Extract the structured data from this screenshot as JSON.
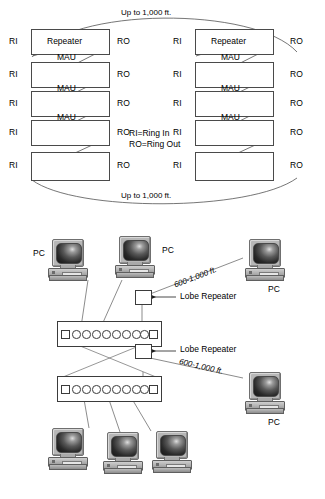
{
  "figure": {
    "colors": {
      "line": "#3b3b3b",
      "box_stroke": "#4a4a4a",
      "text": "#000000",
      "background": "#ffffff"
    }
  },
  "top_diagram": {
    "arc_label_top": "Up to 1,000 ft.",
    "arc_label_bottom": "Up to 1,000 ft.",
    "legend": {
      "line1": "RI=Ring In",
      "line2": "RO=Ring Out"
    },
    "port_in_label": "RI",
    "port_out_label": "RO",
    "left_column": [
      {
        "box_label": "Repeater",
        "under_label": "MAU",
        "ri": "RI",
        "ro": "RO"
      },
      {
        "box_label": "",
        "under_label": "MAU",
        "ri": "RI",
        "ro": "RO"
      },
      {
        "box_label": "",
        "under_label": "MAU",
        "ri": "RI",
        "ro": "RO"
      },
      {
        "box_label": "",
        "under_label": "",
        "ri": "RI",
        "ro": "RO"
      },
      {
        "box_label": "",
        "under_label": "",
        "ri": "RI",
        "ro": "RO"
      }
    ],
    "right_column": [
      {
        "box_label": "Repeater",
        "under_label": "MAU",
        "ri": "RI",
        "ro": "RO"
      },
      {
        "box_label": "",
        "under_label": "MAU",
        "ri": "RI",
        "ro": "RO"
      },
      {
        "box_label": "",
        "under_label": "MAU",
        "ri": "RI",
        "ro": "RO"
      },
      {
        "box_label": "",
        "under_label": "",
        "ri": "RI",
        "ro": "RO"
      },
      {
        "box_label": "",
        "under_label": "",
        "ri": "RI",
        "ro": "RO"
      }
    ]
  },
  "bottom_diagram": {
    "pc_label": "PC",
    "lobe_repeater_label_1": "Lobe Repeater",
    "lobe_repeater_label_2": "Lobe Repeater",
    "distance_label_1": "600-1,000 ft.",
    "distance_label_2": "600-1,000 ft.",
    "mau_ports_per_strip": 8,
    "strips": [
      {
        "name": "upper-mau",
        "ri_connector": "RI",
        "ro_connector": "RO"
      },
      {
        "name": "lower-mau",
        "ri_connector": "RI",
        "ro_connector": "RO"
      }
    ],
    "workstations": [
      {
        "name": "pc-top-left",
        "label": "PC"
      },
      {
        "name": "pc-top-mid",
        "label": "PC"
      },
      {
        "name": "pc-top-right",
        "label": "PC"
      },
      {
        "name": "pc-mid-right",
        "label": "PC"
      },
      {
        "name": "pc-bottom-1",
        "label": ""
      },
      {
        "name": "pc-bottom-2",
        "label": ""
      },
      {
        "name": "pc-bottom-3",
        "label": ""
      }
    ]
  }
}
